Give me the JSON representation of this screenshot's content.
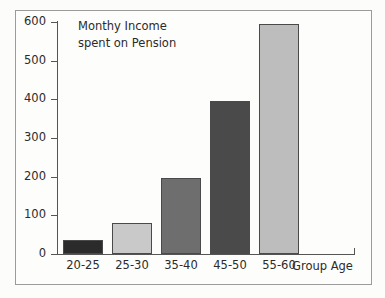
{
  "chart_data": {
    "type": "bar",
    "title": "Monthy Income spent on Pension",
    "title_line1": "Monthy Income",
    "title_line2": "spent on Pension",
    "xlabel": "Group Age",
    "ylabel": "",
    "categories": [
      "20-25",
      "25-30",
      "35-40",
      "45-50",
      "55-60"
    ],
    "values": [
      36,
      80,
      197,
      395,
      595
    ],
    "bar_colors": [
      "#2b2b2b",
      "#c9c9c9",
      "#6e6e6e",
      "#4a4a4a",
      "#bdbdbd"
    ],
    "ylim": [
      0,
      600
    ],
    "yticks": [
      0,
      100,
      200,
      300,
      400,
      500,
      600
    ],
    "ytick_labels": [
      "0",
      "100",
      "200",
      "300",
      "400",
      "500",
      "600"
    ],
    "grid": false,
    "legend": null
  },
  "figure": {
    "border_color": "#9b9b9b",
    "background": "#fdfdfc",
    "axis_color": "#555555",
    "text_color": "#2b2b2b"
  }
}
